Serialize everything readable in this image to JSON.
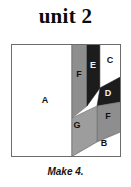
{
  "title": "unit 2",
  "caption": "Make 4.",
  "block": {
    "outline_color": "#6b6b6b",
    "background": "#ffffff",
    "patches": [
      {
        "id": "A",
        "label": "A",
        "fill": "#ffffff",
        "label_color": "dark",
        "label_x": 34,
        "label_y": 57
      },
      {
        "id": "F-upper",
        "label": "F",
        "fill": "#8e8e8e",
        "label_color": "dark",
        "label_x": 68,
        "label_y": 31
      },
      {
        "id": "E",
        "label": "E",
        "fill": "#1c1c1c",
        "label_color": "light",
        "label_x": 82,
        "label_y": 22
      },
      {
        "id": "C",
        "label": "C",
        "fill": "#ffffff",
        "label_color": "dark",
        "label_x": 97,
        "label_y": 17
      },
      {
        "id": "D",
        "label": "D",
        "fill": "#1c1c1c",
        "label_color": "light",
        "label_x": 93,
        "label_y": 51
      },
      {
        "id": "F-lower",
        "label": "F",
        "fill": "#8e8e8e",
        "label_color": "dark",
        "label_x": 95,
        "label_y": 73
      },
      {
        "id": "G",
        "label": "G",
        "fill": "#9d9d9d",
        "label_color": "dark",
        "label_x": 66,
        "label_y": 79
      },
      {
        "id": "B",
        "label": "B",
        "fill": "#ffffff",
        "label_color": "dark",
        "label_x": 93,
        "label_y": 99
      }
    ]
  },
  "colors": {
    "ink": "#0a0a0a",
    "outline": "#6b6b6b",
    "dark_patch": "#1c1c1c",
    "mid_patch": "#8e8e8e",
    "light_patch": "#9d9d9d",
    "white_patch": "#ffffff"
  }
}
